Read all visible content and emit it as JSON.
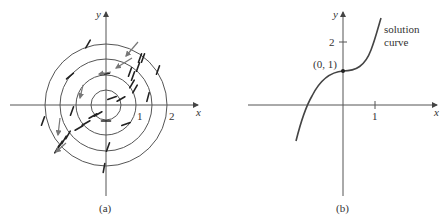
{
  "panel_a": {
    "caption": "(a)",
    "x_label": "x",
    "y_label": "y",
    "tick_labels": [
      "1",
      "2"
    ],
    "center": [
      106,
      105
    ],
    "circle_radii": [
      15,
      30,
      46,
      61
    ],
    "marks": [
      [
        98,
        114,
        -30
      ],
      [
        121,
        99,
        -30
      ],
      [
        112,
        98,
        -20
      ],
      [
        106,
        121,
        0
      ],
      [
        126,
        124,
        -20
      ],
      [
        93,
        116,
        -30
      ],
      [
        86,
        123,
        -30
      ],
      [
        79,
        128,
        -30
      ],
      [
        72,
        111,
        -70
      ],
      [
        68,
        135,
        -60
      ],
      [
        64,
        140,
        -60
      ],
      [
        60,
        145,
        -60
      ],
      [
        57,
        149,
        -60
      ],
      [
        43,
        121,
        -70
      ],
      [
        108,
        147,
        -70
      ],
      [
        104,
        168,
        -80
      ],
      [
        132,
        84,
        -60
      ],
      [
        135,
        89,
        -60
      ],
      [
        130,
        72,
        -70
      ],
      [
        133,
        76,
        -70
      ],
      [
        138,
        67,
        -70
      ],
      [
        140,
        58,
        -70
      ],
      [
        143,
        58,
        -70
      ],
      [
        148,
        97,
        -75
      ],
      [
        158,
        70,
        -70
      ],
      [
        88,
        44,
        -60
      ],
      [
        70,
        76,
        -40
      ],
      [
        105,
        74,
        -10
      ]
    ],
    "arrows": [
      [
        138,
        42,
        126,
        56
      ],
      [
        132,
        58,
        116,
        68
      ],
      [
        111,
        72,
        99,
        74
      ],
      [
        83,
        85,
        80,
        98
      ],
      [
        60,
        118,
        58,
        135
      ],
      [
        66,
        143,
        56,
        152
      ]
    ]
  },
  "panel_b": {
    "caption": "(b)",
    "x_label": "x",
    "y_label": "y",
    "x_tick_label": "1",
    "y_tick_label": "2",
    "point_label": "(0, 1)",
    "curve_label_line1": "solution",
    "curve_label_line2": "curve"
  },
  "chart_data": [
    {
      "type": "diagram",
      "title": "(a) direction field with isoclines (circles)",
      "isocline_radii": [
        0.5,
        1,
        1.5,
        2
      ],
      "xlabel": "x",
      "ylabel": "y",
      "x_ticks": [
        1,
        2
      ]
    },
    {
      "type": "line",
      "title": "(b) solution curve through (0, 1)",
      "xlabel": "x",
      "ylabel": "y",
      "x_ticks": [
        1
      ],
      "y_ticks": [
        2
      ],
      "point": [
        0,
        1
      ],
      "x": [
        -1.4,
        -1.1,
        -0.8,
        -0.5,
        -0.2,
        0,
        0.2,
        0.5,
        0.8,
        1.1
      ],
      "y": [
        -1.1,
        0,
        0.55,
        0.88,
        0.99,
        1.0,
        1.02,
        1.15,
        1.6,
        2.8
      ]
    }
  ]
}
